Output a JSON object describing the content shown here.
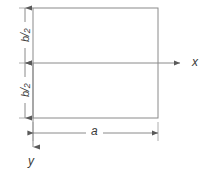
{
  "figure": {
    "type": "engineering-dimension-diagram",
    "background_color": "#ffffff",
    "line_color": "#8a8a8a",
    "text_color": "#3a3a3a"
  },
  "shape": {
    "name": "rectangle",
    "x": 33,
    "y": 8,
    "width": 125,
    "height": 110
  },
  "axes": [
    {
      "id": "x-axis",
      "label": "x",
      "direction": "right",
      "start_x": 33,
      "start_y": 63,
      "end_x": 186,
      "end_y": 63,
      "label_x": 192,
      "label_y": 57
    },
    {
      "id": "y-axis",
      "label": "y",
      "direction": "down",
      "start_x": 33,
      "start_y": 63,
      "end_x": 33,
      "end_y": 152,
      "label_x": 28,
      "label_y": 156
    }
  ],
  "dimensions": [
    {
      "id": "b-over-2-upper",
      "numerator": "b",
      "slash": "/",
      "denominator": "2",
      "orientation": "vertical",
      "line_x": 25,
      "from_y": 8,
      "to_y": 63,
      "label_x": 6,
      "label_y": 26
    },
    {
      "id": "b-over-2-lower",
      "numerator": "b",
      "slash": "/",
      "denominator": "2",
      "orientation": "vertical",
      "line_x": 25,
      "from_y": 63,
      "to_y": 118,
      "label_x": 6,
      "label_y": 81
    },
    {
      "id": "a-width",
      "label": "a",
      "orientation": "horizontal",
      "line_y": 133,
      "from_x": 33,
      "to_x": 158,
      "label_x": 92,
      "label_y": 126
    }
  ]
}
